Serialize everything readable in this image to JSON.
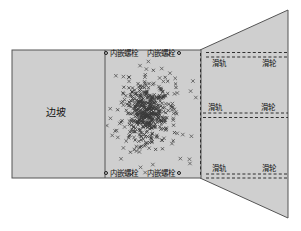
{
  "figure": {
    "background_color": "#ffffff",
    "fill_color": "#cfcfcf",
    "stroke_color": "#4a4a4a",
    "marker_color": "#3a3a3a",
    "slope_label": "边坡",
    "bolt_label": "内嵌螺栓",
    "rail_label": "滑轨",
    "pulley_label": "滑轮",
    "bolt_marker_icon": "circle-marker",
    "scatter_marker_icon": "x-marker"
  },
  "labels": {
    "slope": "边坡",
    "bolt_top_left": "内嵌螺栓",
    "bolt_top_right": "内嵌螺栓",
    "bolt_bottom_left": "内嵌螺栓",
    "bolt_bottom_right": "内嵌螺栓",
    "rail_1": "滑轨",
    "pulley_1": "滑轮",
    "rail_2": "滑轨",
    "pulley_2": "滑轮",
    "rail_3": "滑轨",
    "pulley_3": "滑轮"
  },
  "chart_data": {
    "type": "scatter",
    "title": "",
    "xlabel": "",
    "ylabel": "",
    "xlim": [
      105,
      205
    ],
    "ylim": [
      50,
      178
    ],
    "grid": false,
    "legend": "none",
    "marker": "x",
    "center": [
      147,
      112
    ],
    "n_points": 520
  }
}
